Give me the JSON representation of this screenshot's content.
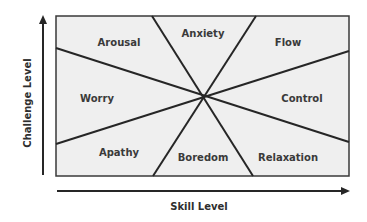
{
  "axes": {
    "x_label": "Skill Level",
    "y_label": "Challenge Level"
  },
  "regions": [
    {
      "name": "Arousal"
    },
    {
      "name": "Anxiety"
    },
    {
      "name": "Flow"
    },
    {
      "name": "Worry"
    },
    {
      "name": "Control"
    },
    {
      "name": "Apathy"
    },
    {
      "name": "Boredom"
    },
    {
      "name": "Relaxation"
    }
  ],
  "colors": {
    "box_fill": "#efefef",
    "line": "#2b2b2b",
    "text": "#3a3a3a"
  }
}
